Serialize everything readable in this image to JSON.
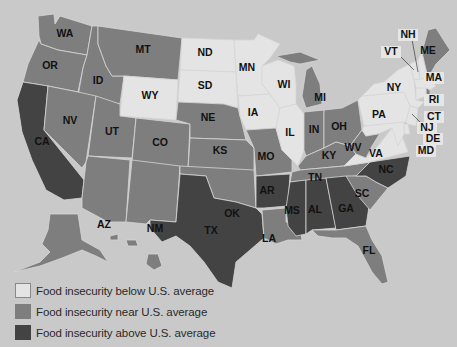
{
  "colors": {
    "background": "#c9c9c9",
    "below": "#e4e4e4",
    "near": "#7e7e7e",
    "above": "#434343"
  },
  "legend": [
    {
      "key": "below",
      "label": "Food insecurity below U.S. average"
    },
    {
      "key": "near",
      "label": "Food insecurity near U.S. average"
    },
    {
      "key": "above",
      "label": "Food insecurity above U.S. average"
    }
  ],
  "states": {
    "WA": "near",
    "OR": "near",
    "CA": "above",
    "ID": "near",
    "NV": "near",
    "MT": "near",
    "WY": "below",
    "UT": "near",
    "AZ": "near",
    "CO": "near",
    "NM": "near",
    "ND": "below",
    "SD": "below",
    "NE": "near",
    "KS": "near",
    "OK": "near",
    "TX": "above",
    "MN": "below",
    "IA": "below",
    "MO": "near",
    "AR": "above",
    "LA": "near",
    "WI": "below",
    "IL": "below",
    "MI": "near",
    "IN": "near",
    "OH": "near",
    "KY": "near",
    "TN": "near",
    "MS": "above",
    "AL": "above",
    "GA": "above",
    "FL": "near",
    "SC": "near",
    "NC": "above",
    "VA": "below",
    "WV": "near",
    "PA": "below",
    "NY": "below",
    "VT": "below",
    "NH": "below",
    "ME": "near",
    "MA": "below",
    "RI": "near",
    "CT": "below",
    "NJ": "below",
    "DE": "below",
    "MD": "below",
    "AK": "near",
    "HI": "near"
  },
  "labels": {
    "WA": "WA",
    "OR": "OR",
    "CA": "CA",
    "ID": "ID",
    "NV": "NV",
    "MT": "MT",
    "WY": "WY",
    "UT": "UT",
    "AZ": "AZ",
    "CO": "CO",
    "NM": "NM",
    "ND": "ND",
    "SD": "SD",
    "NE": "NE",
    "KS": "KS",
    "OK": "OK",
    "TX": "TX",
    "MN": "MN",
    "IA": "IA",
    "MO": "MO",
    "AR": "AR",
    "LA": "LA",
    "WI": "WI",
    "IL": "IL",
    "MI": "MI",
    "IN": "IN",
    "OH": "OH",
    "KY": "KY",
    "TN": "TN",
    "MS": "MS",
    "AL": "AL",
    "GA": "GA",
    "FL": "FL",
    "SC": "SC",
    "NC": "NC",
    "VA": "VA",
    "WV": "WV",
    "PA": "PA",
    "NY": "NY",
    "VT": "VT",
    "NH": "NH",
    "ME": "ME",
    "MA": "MA",
    "RI": "RI",
    "CT": "CT",
    "NJ": "NJ",
    "DE": "DE",
    "MD": "MD"
  }
}
